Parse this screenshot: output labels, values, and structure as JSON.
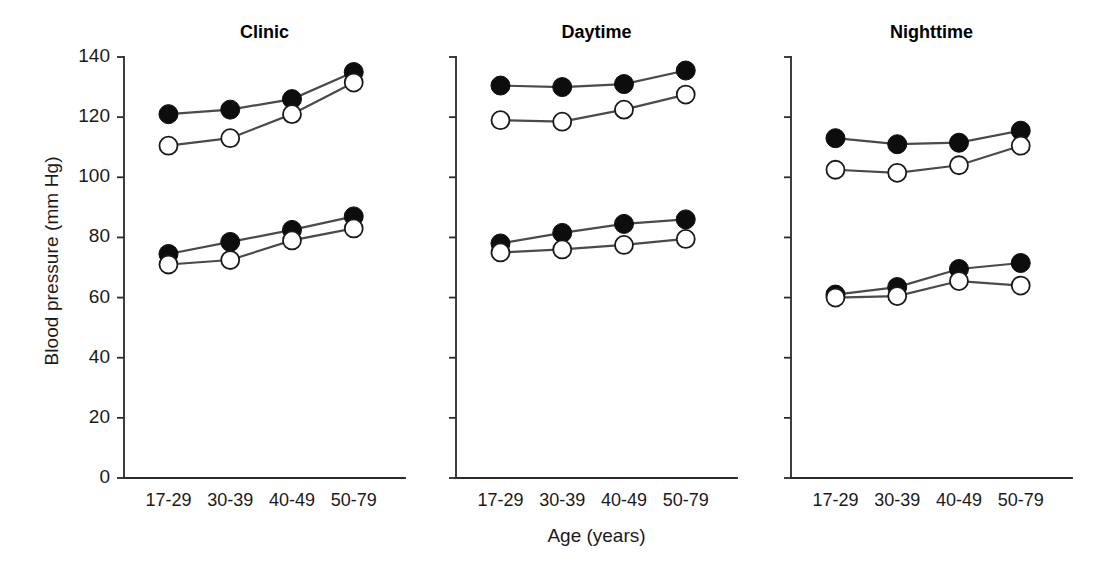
{
  "figure": {
    "ylabel": "Blood pressure (mm Hg)",
    "xlabel": "Age (years)"
  },
  "chart_data": {
    "type": "line",
    "title": "",
    "xlabel": "Age (years)",
    "ylabel": "Blood pressure (mm Hg)",
    "ylim": [
      0,
      140
    ],
    "yticks": [
      0,
      20,
      40,
      60,
      80,
      100,
      120,
      140
    ],
    "ytick_labels": [
      "0",
      "20",
      "40",
      "60",
      "80",
      "100",
      "120",
      "140"
    ],
    "categories": [
      "17-29",
      "30-39",
      "40-49",
      "50-79"
    ],
    "grid": false,
    "legend": "none",
    "marker_styles": {
      "filled": "filled-circle",
      "open": "open-circle"
    },
    "panels": [
      {
        "title": "Clinic",
        "series": [
          {
            "name": "Systolic filled",
            "marker": "filled",
            "values": [
              121,
              122.5,
              126,
              135
            ]
          },
          {
            "name": "Systolic open",
            "marker": "open",
            "values": [
              110.5,
              113,
              121,
              131.5
            ]
          },
          {
            "name": "Diastolic filled",
            "marker": "filled",
            "values": [
              74.5,
              78.5,
              82.5,
              87
            ]
          },
          {
            "name": "Diastolic open",
            "marker": "open",
            "values": [
              71,
              72.5,
              79,
              83
            ]
          }
        ]
      },
      {
        "title": "Daytime",
        "series": [
          {
            "name": "Systolic filled",
            "marker": "filled",
            "values": [
              130.5,
              130,
              131,
              135.5
            ]
          },
          {
            "name": "Systolic open",
            "marker": "open",
            "values": [
              119,
              118.5,
              122.5,
              127.5
            ]
          },
          {
            "name": "Diastolic filled",
            "marker": "filled",
            "values": [
              78,
              81.5,
              84.5,
              86
            ]
          },
          {
            "name": "Diastolic open",
            "marker": "open",
            "values": [
              75,
              76,
              77.5,
              79.5
            ]
          }
        ]
      },
      {
        "title": "Nighttime",
        "series": [
          {
            "name": "Systolic filled",
            "marker": "filled",
            "values": [
              113,
              111,
              111.5,
              115.5
            ]
          },
          {
            "name": "Systolic open",
            "marker": "open",
            "values": [
              102.5,
              101.5,
              104,
              110.5
            ]
          },
          {
            "name": "Diastolic filled",
            "marker": "filled",
            "values": [
              61,
              63.5,
              69.5,
              71.5
            ]
          },
          {
            "name": "Diastolic open",
            "marker": "open",
            "values": [
              60,
              60.5,
              65.5,
              64
            ]
          }
        ]
      }
    ]
  }
}
